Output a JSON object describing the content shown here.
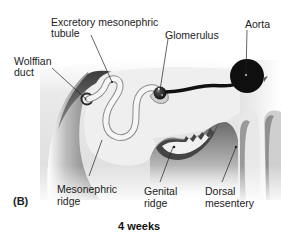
{
  "figure": {
    "panel_label": "(B)",
    "caption": "4 weeks",
    "labels": {
      "excretory_tubule_line1": "Excretory mesonephric",
      "excretory_tubule_line2": "tubule",
      "glomerulus": "Glomerulus",
      "aorta": "Aorta",
      "wolffian_line1": "Wolffian",
      "wolffian_line2": "duct",
      "mesonephric_ridge_line1": "Mesonephric",
      "mesonephric_ridge_line2": "ridge",
      "genital_ridge_line1": "Genital",
      "genital_ridge_line2": "ridge",
      "dorsal_mesentery_line1": "Dorsal",
      "dorsal_mesentery_line2": "mesentery"
    },
    "colors": {
      "tissue_dark": "#3a3a3a",
      "tissue_mid": "#9a9a9a",
      "tissue_light": "#e6e6e6",
      "ridge_face": "#efefef",
      "vessel": "#111111",
      "tubule": "#f4f4f4"
    }
  }
}
